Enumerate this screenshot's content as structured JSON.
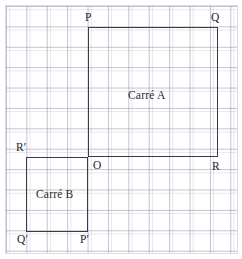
{
  "figure": {
    "type": "geometry-diagram",
    "width": 242,
    "height": 259,
    "background_color": "#ffffff",
    "grid": {
      "visible": true,
      "cell_size": 20.4,
      "major_line_color": "#8c92aa",
      "minor_line_color": "#aab2cd",
      "origin": {
        "x": 6,
        "y": 6
      },
      "columns": 11,
      "rows": 12
    },
    "stroke_color": "#3b3b3b",
    "label_color": "#1f1f1f"
  },
  "captions": {
    "square_a": "Carré A",
    "square_b": "Carré B"
  },
  "shapes": [
    {
      "name": "square-a",
      "caption": "Carré A",
      "x": 88,
      "y": 27,
      "width": 130,
      "height": 130,
      "vertices": [
        "P",
        "Q",
        "R",
        "O"
      ]
    },
    {
      "name": "square-b",
      "caption": "Carré B",
      "x": 26,
      "y": 157,
      "width": 62,
      "height": 75,
      "vertices": [
        "R'",
        "O",
        "P'",
        "Q'"
      ]
    }
  ],
  "vertex_labels": {
    "p": "P",
    "q": "Q",
    "o": "O",
    "r": "R",
    "r_prime": "R′",
    "q_prime": "Q′",
    "p_prime": "P′"
  }
}
